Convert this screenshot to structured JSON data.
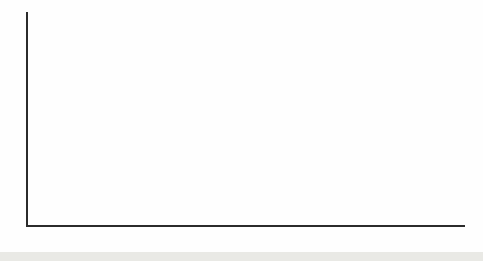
{
  "caption": {
    "fragment": "mostly agree."
  },
  "chart_data": {
    "type": "bar",
    "orientation": "horizontal",
    "title": "",
    "xlabel": "",
    "ylabel": "",
    "xlim": [
      0,
      70
    ],
    "xticks": [
      0,
      10,
      20,
      30,
      40,
      50,
      60,
      70
    ],
    "grid": false,
    "legend": false,
    "categories": [
      "Male",
      "Female",
      "White",
      "Nonwhite",
      "Democrat",
      "Independent",
      "Republican",
      "Very conservative",
      "Conservative",
      "Moderate",
      "Liberal",
      "Very liberal"
    ],
    "values": [
      47,
      51,
      49,
      47,
      49,
      62,
      39,
      30,
      50,
      46,
      45,
      57
    ],
    "groups": [
      {
        "name": "Gender",
        "color": "#a0a0a0",
        "items": [
          {
            "label": "Male",
            "value": 47
          },
          {
            "label": "Female",
            "value": 51
          }
        ]
      },
      {
        "name": "Race",
        "color": "#696969",
        "items": [
          {
            "label": "White",
            "value": 49
          },
          {
            "label": "Nonwhite",
            "value": 47
          }
        ]
      },
      {
        "name": "Political party",
        "color": "#5c5c5c",
        "items": [
          {
            "label": "Democrat",
            "value": 49
          },
          {
            "label": "Independent",
            "value": 62
          },
          {
            "label": "Republican",
            "value": 39
          }
        ]
      },
      {
        "name": "Ideology",
        "color": "#c6c6c6",
        "items": [
          {
            "label": "Very conservative",
            "value": 30
          },
          {
            "label": "Conservative",
            "value": 50
          },
          {
            "label": "Moderate",
            "value": 46
          },
          {
            "label": "Liberal",
            "value": 45
          },
          {
            "label": "Very liberal",
            "value": 57
          }
        ]
      }
    ],
    "colors": {
      "axis": "#2b2b2b",
      "bar_label_text": "#3c3c3c",
      "bottom_band": "#e9e9e5"
    }
  }
}
